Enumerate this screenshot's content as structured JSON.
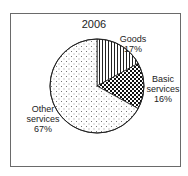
{
  "chart_data": {
    "type": "pie",
    "title": "2006",
    "slices": [
      {
        "label": "Goods",
        "value": 17,
        "pattern": "vertical-lines"
      },
      {
        "label": "Basic services",
        "value": 16,
        "pattern": "checkerboard"
      },
      {
        "label": "Other services",
        "value": 67,
        "pattern": "dots"
      }
    ],
    "categories": [
      "Goods",
      "Basic services",
      "Other services"
    ],
    "values": [
      17,
      16,
      67
    ],
    "unit": "%",
    "start_angle": "12 o'clock",
    "direction": "clockwise",
    "legend": "none (direct labels)"
  },
  "labels": {
    "goods_name": "Goods",
    "goods_pct": "17%",
    "basic_line1": "Basic",
    "basic_line2": "services",
    "basic_pct": "16%",
    "other_line1": "Other",
    "other_line2": "services",
    "other_pct": "67%"
  }
}
